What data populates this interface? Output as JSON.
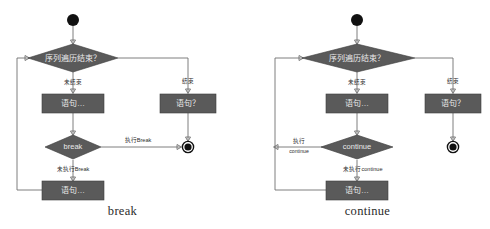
{
  "figure": {
    "background_color": "#ffffff",
    "node_fill_color": "#5a5a5a",
    "node_text_color": "#e9e9e9",
    "edge_color": "#6f6f6f",
    "terminal_color": "#111111"
  },
  "panels": [
    {
      "id": "break",
      "caption": "break",
      "start_node": "●",
      "condition": "序列遍历结束？",
      "branch_false_label": "未结束",
      "branch_true_label": "结束",
      "body_statement": "语句…",
      "exit_statement": "语句？",
      "keyword_decision": "break",
      "keyword_taken_label": "执行Break",
      "keyword_not_taken_label": "未执行Break",
      "tail_statement": "语句…",
      "end_node_keyword": "◉",
      "end_node_exit": "◉"
    },
    {
      "id": "continue",
      "caption": "continue",
      "start_node": "●",
      "condition": "序列遍历结束？",
      "branch_false_label": "未结束",
      "branch_true_label": "结束",
      "body_statement": "语句…",
      "exit_statement": "语句？",
      "keyword_decision": "continue",
      "keyword_taken_label_line1": "执行",
      "keyword_taken_label_line2": "continue",
      "keyword_not_taken_label": "未执行continue",
      "tail_statement": "语句…",
      "end_node_exit": "◉"
    }
  ]
}
